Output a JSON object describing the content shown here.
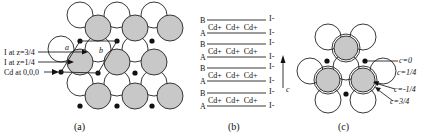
{
  "panel_a": {
    "caption": "(a)",
    "labels": {
      "i_three_quarter": "I at z=3/4",
      "i_one_quarter": "I at z=1/4",
      "cd_origin": "Cd at 0,0,0"
    },
    "axis_a": "a",
    "axis_b": "b"
  },
  "panel_b": {
    "caption": "(b)",
    "layers": [
      {
        "top": "B",
        "bottom": "A",
        "middle": "Cd+  Cd+  Cd+",
        "right_top": "I-",
        "right_bottom": "I-"
      },
      {
        "top": "B",
        "bottom": "A",
        "middle": "Cd+  Cd+  Cd+",
        "right_top": "I-",
        "right_bottom": "I-"
      },
      {
        "top": "B",
        "bottom": "A",
        "middle": "Cd+  Cd+  Cd+",
        "right_top": "I-",
        "right_bottom": "I-"
      },
      {
        "top": "B",
        "bottom": "A",
        "middle": "Cd+  Cd+  Cd+",
        "right_top": "I-",
        "right_bottom": "I-"
      }
    ],
    "axis_c": "c"
  },
  "panel_c": {
    "caption": "(c)",
    "labels": {
      "c0": "c=0",
      "c1_4": "c=1/4",
      "cneg1_4": "c=-1/4",
      "c3_4": "c=3/4"
    }
  },
  "colors": {
    "shaded_fill": "#c8c8c8",
    "stroke": "#222222"
  }
}
